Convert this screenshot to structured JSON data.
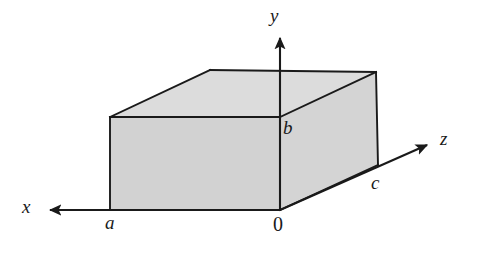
{
  "figure": {
    "background_color": "#ffffff",
    "line_color": "#1a1a1a"
  },
  "axes": [
    {
      "id": "x",
      "label": "x",
      "direction": "left",
      "arrow": true,
      "tip": {
        "x": 44,
        "y": 210
      },
      "origin": {
        "x": 280,
        "y": 210
      }
    },
    {
      "id": "y",
      "label": "y",
      "direction": "up",
      "arrow": true,
      "tip": {
        "x": 280,
        "y": 32
      },
      "origin": {
        "x": 280,
        "y": 210
      }
    },
    {
      "id": "z",
      "label": "z",
      "direction": "lower-right-to-upper-right",
      "arrow": true,
      "tip": {
        "x": 432,
        "y": 143
      },
      "origin": {
        "x": 280,
        "y": 210
      }
    }
  ],
  "labels": {
    "origin": "0",
    "edge_x": "a",
    "edge_y": "b",
    "edge_z": "c",
    "axis_x": "x",
    "axis_y": "y",
    "axis_z": "z"
  },
  "solid": {
    "name": "rectangular-box",
    "faces": [
      {
        "name": "front-face",
        "fill": "#d2d2d2",
        "points": "110,117 280,117 280,210 110,210"
      },
      {
        "name": "top-face",
        "fill": "#dcdcdc",
        "points": "110,117 210,70 376,72 280,117"
      },
      {
        "name": "right-face",
        "fill": "#d4d4d4",
        "points": "280,117 376,72 378,165 280,210"
      }
    ],
    "vertices": {
      "origin_front_bottom_right": {
        "x": 280,
        "y": 210
      },
      "front_bottom_left": {
        "x": 110,
        "y": 210
      },
      "front_top_left": {
        "x": 110,
        "y": 117
      },
      "front_top_right": {
        "x": 280,
        "y": 117
      },
      "back_top_left": {
        "x": 210,
        "y": 70
      },
      "back_top_right": {
        "x": 376,
        "y": 72
      },
      "back_bottom_right": {
        "x": 378,
        "y": 165
      }
    },
    "edge_lengths": {
      "x_edge": "a",
      "y_edge": "b",
      "z_edge": "c"
    }
  }
}
